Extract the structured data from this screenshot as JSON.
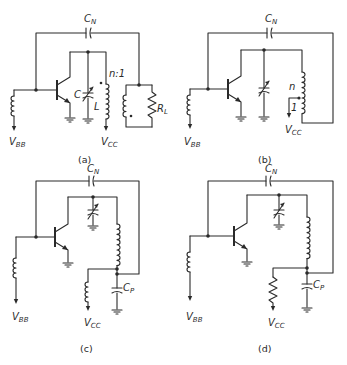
{
  "figure": {
    "panels": [
      {
        "id": "a",
        "caption": "(a)",
        "labels": {
          "neutralizing_cap": "C",
          "neutralizing_cap_sub": "N",
          "tank_cap": "C",
          "tank_inductor": "L",
          "turns_ratio": "n:1",
          "load": "R",
          "load_sub": "L",
          "base_supply": "V",
          "base_supply_sub": "BB",
          "collector_supply": "V",
          "collector_supply_sub": "CC"
        }
      },
      {
        "id": "b",
        "caption": "(b)",
        "labels": {
          "neutralizing_cap": "C",
          "neutralizing_cap_sub": "N",
          "tap_upper": "n",
          "tap_lower": "1",
          "base_supply": "V",
          "base_supply_sub": "BB",
          "collector_supply": "V",
          "collector_supply_sub": "CC"
        }
      },
      {
        "id": "c",
        "caption": "(c)",
        "labels": {
          "neutralizing_cap": "C",
          "neutralizing_cap_sub": "N",
          "bypass_cap": "C",
          "bypass_cap_sub": "P",
          "base_supply": "V",
          "base_supply_sub": "BB",
          "collector_supply": "V",
          "collector_supply_sub": "CC"
        }
      },
      {
        "id": "d",
        "caption": "(d)",
        "labels": {
          "neutralizing_cap": "C",
          "neutralizing_cap_sub": "N",
          "bypass_cap": "C",
          "bypass_cap_sub": "P",
          "base_supply": "V",
          "base_supply_sub": "BB",
          "collector_supply": "V",
          "collector_supply_sub": "CC"
        }
      }
    ]
  }
}
